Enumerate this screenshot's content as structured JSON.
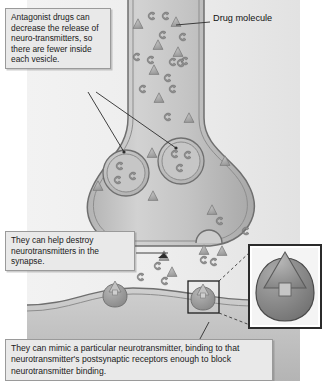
{
  "figure": {
    "topic": "antagonist-drug-action-at-synapse",
    "background_color": "#ffffff"
  },
  "callouts": {
    "release": "Antagonist drugs can decrease the release of neuro-transmitters, so there are fewer inside each vesicle.",
    "destroy": "They can help destroy neurotransmitters in the synapse.",
    "mimic": "They can mimic a particular neurotransmitter, binding to that neurotransmitter's postsynaptic receptors enough to block neurotransmitter binding."
  },
  "labels": {
    "drug_molecule": "Drug molecule"
  },
  "colors": {
    "callout_fill": "#e9e9e9",
    "callout_border": "#9a9a9a",
    "cell_fill": "#c9c9c9",
    "membrane_line": "#6f6f6f",
    "drug_molecule": "#a6a6a6",
    "neurotransmitter": "#8a8a8a",
    "vesicle_fill": "#bdbdbd",
    "receptor": "#9b9b9b",
    "inset_border": "#2b2b2b",
    "text": "#1a1a1a"
  },
  "diagram_elements": {
    "axon_terminal": "presynaptic-axon-terminal-bouton",
    "vesicles": 2,
    "neurotransmitters_per_vesicle": 3,
    "fusing_vesicle": 1,
    "receptors_on_postsynaptic_membrane": 2,
    "inset": "magnified-drug-bound-receptor",
    "drug_shape": "triangle",
    "neurotransmitter_shape": "c-shape"
  }
}
